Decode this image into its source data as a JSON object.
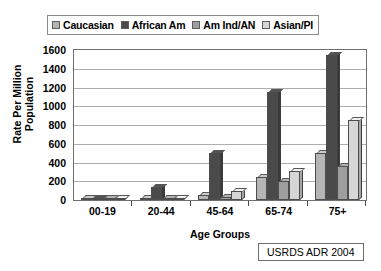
{
  "chart_data": {
    "type": "bar",
    "title": "",
    "xlabel": "Age Groups",
    "ylabel": "Rate Per Million Population",
    "ylabel_lines": [
      "Rate Per Million",
      "Population"
    ],
    "categories": [
      "00-19",
      "20-44",
      "45-64",
      "65-74",
      "75+"
    ],
    "ylim": [
      0,
      1600
    ],
    "ytick_step": 200,
    "yticks": [
      0,
      200,
      400,
      600,
      800,
      1000,
      1200,
      1400,
      1600
    ],
    "ytick_labels": [
      "0",
      "200",
      "400",
      "600",
      "800",
      "1000",
      "1200",
      "1400",
      "1600"
    ],
    "grid": true,
    "legend_position": "top",
    "series": [
      {
        "name": "Caucasian",
        "color": "#b5b5b5",
        "values": [
          5,
          12,
          55,
          250,
          500
        ]
      },
      {
        "name": "African Am",
        "color": "#4a4a4a",
        "values": [
          10,
          140,
          500,
          1150,
          1550
        ]
      },
      {
        "name": "Am Ind/AN",
        "color": "#9e9e9e",
        "values": [
          3,
          10,
          35,
          205,
          360
        ]
      },
      {
        "name": "Asian/PI",
        "color": "#d6d6d6",
        "values": [
          4,
          15,
          95,
          310,
          850
        ]
      }
    ]
  },
  "legend": {
    "items": [
      {
        "label": "Caucasian",
        "swatch": "#b5b5b5"
      },
      {
        "label": "African Am",
        "swatch": "#4a4a4a"
      },
      {
        "label": "Am Ind/AN",
        "swatch": "#9e9e9e"
      },
      {
        "label": "Asian/PI",
        "swatch": "#d6d6d6"
      }
    ]
  },
  "caption": {
    "text": "USRDS ADR 2004"
  },
  "colors": {
    "axis": "#4a4a4a",
    "grid": "#adadad",
    "frame": "#6f6f6f",
    "background": "#ffffff",
    "text": "#000000"
  }
}
